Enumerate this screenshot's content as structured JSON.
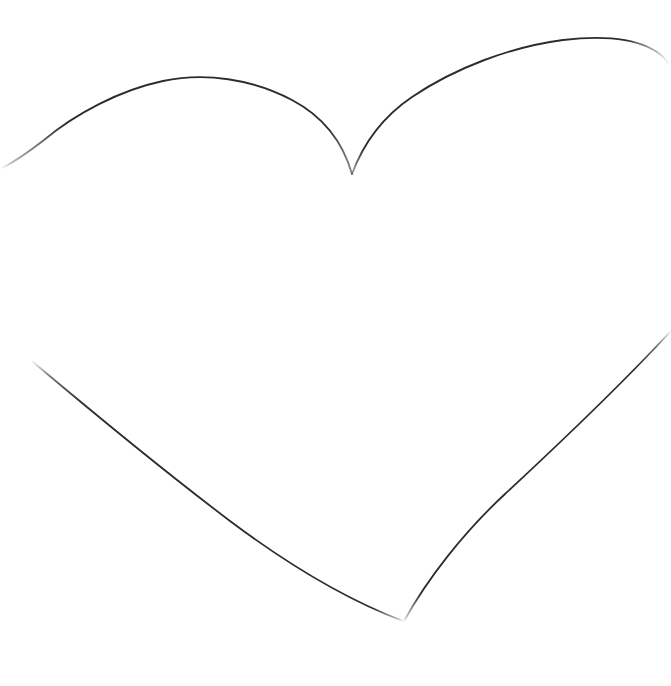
{
  "canvas": {
    "width": 671,
    "height": 686,
    "background_color": "#ffffff",
    "title": "Heart Outline Drawing"
  },
  "artwork": {
    "subject": "heart-outline",
    "style": "hand-drawn single-line contour sketch",
    "ink_color": "#2b2b33",
    "ink_color_light": "#3a3a44",
    "stroke_width": 1.8,
    "closed": false,
    "notes": "Incomplete outline: gaps at left edge, right edge, bottom tip and cleft"
  },
  "anchors": {
    "left_lobe_apex_x": 152,
    "left_lobe_apex_y": 82,
    "right_lobe_apex_x": 618,
    "right_lobe_apex_y": 39,
    "cleft_x": 352,
    "cleft_y": 175,
    "bottom_tip_x": 403,
    "bottom_tip_y": 620,
    "left_edge_exit_x": 2,
    "left_edge_exit_y": 167,
    "right_edge_exit_x": 668,
    "right_edge_exit_y": 63,
    "lower_left_start_x": 33,
    "lower_left_start_y": 362,
    "lower_right_start_x": 670,
    "lower_right_start_y": 332
  },
  "strokes": [
    {
      "name": "left-lobe-stroke",
      "description": "Upper left lobe arc from cleft up over apex and down to the left edge",
      "path": "M 352 174 C 344 146 326 118 292 100 C 252 79 205 72 163 81 C 120 90 75 114 44 140 C 26 154 12 163 2 168",
      "width": 1.9,
      "opacity": 0.95
    },
    {
      "name": "right-lobe-stroke",
      "description": "Upper right lobe arc from cleft up over apex and down to the right edge",
      "path": "M 352 174 C 362 147 381 118 412 97 C 455 68 510 47 563 40 C 597 36 628 38 648 47 C 659 52 665 58 668 63",
      "width": 1.9,
      "opacity": 0.95
    },
    {
      "name": "lower-left-stroke",
      "description": "Long lower left flank running down-right toward the bottom tip",
      "path": "M 33 362 C 90 410 160 468 230 521 C 290 566 350 601 403 621",
      "width": 1.8,
      "opacity": 0.95
    },
    {
      "name": "lower-right-stroke",
      "description": "Long lower right flank running down-left toward the bottom tip",
      "path": "M 670 332 C 620 386 560 443 505 494 C 464 532 428 578 404 621",
      "width": 1.8,
      "opacity": 0.95
    }
  ]
}
